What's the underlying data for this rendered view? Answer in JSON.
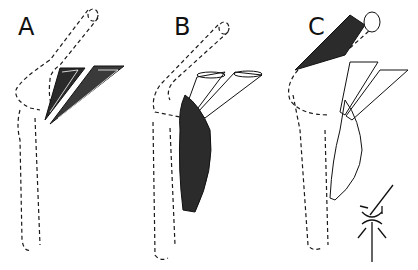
{
  "figure": {
    "panels": [
      {
        "label": "A",
        "description": "Knee joint outline (dashed) with two dark fan-shaped muscle bundles inserting near the joint"
      },
      {
        "label": "B",
        "description": "Knee joint outline (dashed) with two tubular muscles above and a dark fusiform muscle belly along the lower segment"
      },
      {
        "label": "C",
        "description": "Knee joint outline (dashed) with dark muscle on upper segment, two tubular muscles, and light fusiform muscle along lower segment"
      }
    ],
    "inset": {
      "description": "Schematic joint with arrows indicating directions of force"
    }
  }
}
